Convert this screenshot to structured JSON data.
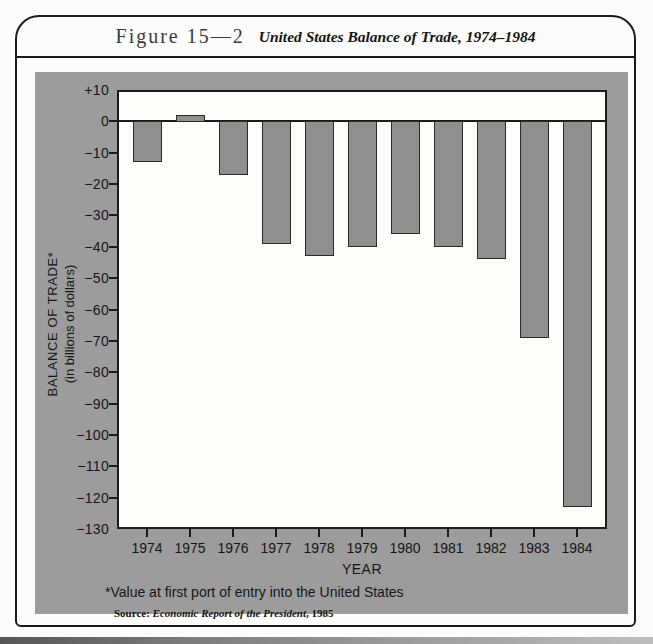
{
  "header": {
    "figure_label": "Figure 15—2",
    "figure_caption": "United States Balance of Trade, 1974–1984"
  },
  "footnote": "*Value at first port of entry into the United States",
  "source": {
    "prefix": "Source: ",
    "italic": "Economic Report of the President",
    "suffix": ", 1985"
  },
  "chart_data": {
    "type": "bar",
    "title": "United States Balance of Trade, 1974–1984",
    "categories": [
      "1974",
      "1975",
      "1976",
      "1977",
      "1978",
      "1979",
      "1980",
      "1981",
      "1982",
      "1983",
      "1984"
    ],
    "values": [
      -13,
      2,
      -17,
      -39,
      -43,
      -40,
      -36,
      -40,
      -44,
      -69,
      -123
    ],
    "xlabel": "YEAR",
    "ylabel_line1": "BALANCE OF TRADE*",
    "ylabel_line2": "(in billions of dollars)",
    "ylim": [
      -130,
      10
    ],
    "ytick_step": 10,
    "yticks": [
      {
        "v": 10,
        "label": "+10"
      },
      {
        "v": 0,
        "label": "0"
      },
      {
        "v": -10,
        "label": "−10"
      },
      {
        "v": -20,
        "label": "−20"
      },
      {
        "v": -30,
        "label": "−30"
      },
      {
        "v": -40,
        "label": "−40"
      },
      {
        "v": -50,
        "label": "−50"
      },
      {
        "v": -60,
        "label": "−60"
      },
      {
        "v": -70,
        "label": "−70"
      },
      {
        "v": -80,
        "label": "−80"
      },
      {
        "v": -90,
        "label": "−90"
      },
      {
        "v": -100,
        "label": "−100"
      },
      {
        "v": -110,
        "label": "−110"
      },
      {
        "v": -120,
        "label": "−120"
      },
      {
        "v": -130,
        "label": "−130"
      }
    ],
    "grid": false,
    "legend": false,
    "colors": {
      "panel_bg": "#9c9c9c",
      "plot_bg": "#fdfdfa",
      "bar_fill": "#8f8f8f",
      "bar_outline": "#2b2b2b",
      "axis": "#1b1b1b"
    }
  }
}
